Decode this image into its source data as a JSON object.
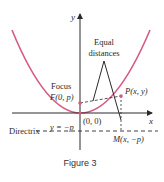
{
  "figure": {
    "caption": "Figure 3",
    "colors": {
      "parabola": "#d65a82",
      "axes": "#2a2a2a",
      "dashed": "#2a2a2a",
      "point": "#d65a82"
    },
    "axes": {
      "x_label": "x",
      "y_label": "y"
    },
    "labels": {
      "equal_distances_line1": "Equal",
      "equal_distances_line2": "distances",
      "focus_word": "Focus",
      "focus_point": "F(0, p)",
      "point_p": "P(x, y)",
      "origin": "(0, 0)",
      "directrix_word": "Directrix",
      "directrix_eq": "y = −p",
      "point_m": "M(x, −p)"
    }
  }
}
